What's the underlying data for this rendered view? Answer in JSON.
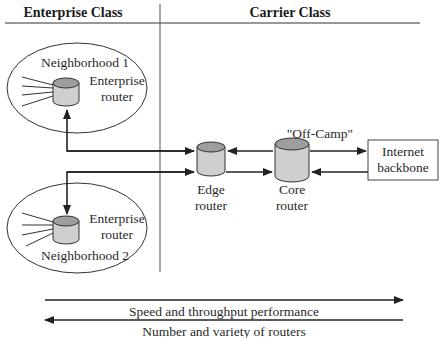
{
  "headers": {
    "enterprise": "Enterprise Class",
    "carrier": "Carrier Class"
  },
  "nodes": {
    "neighborhood1": {
      "label": "Neighborhood 1",
      "router_line1": "Enterprise",
      "router_line2": "router"
    },
    "neighborhood2": {
      "label": "Neighborhood 2",
      "router_line1": "Enterprise",
      "router_line2": "router"
    },
    "edge": {
      "line1": "Edge",
      "line2": "router"
    },
    "core": {
      "line1": "Core",
      "line2": "router"
    },
    "backbone": {
      "line1": "Internet",
      "line2": "backbone"
    },
    "off_camp": "\"Off-Camp\""
  },
  "axes": {
    "speed": "Speed and throughput performance",
    "number": "Number and variety of routers"
  },
  "colors": {
    "router_body": "#cfcfcf",
    "router_top": "#9e9e9e",
    "line": "#222222"
  }
}
